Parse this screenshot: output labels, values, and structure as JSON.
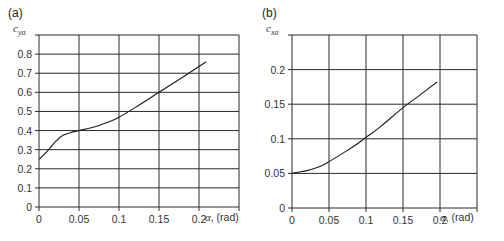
{
  "chart_data": [
    {
      "type": "line",
      "panel_label": "(a)",
      "title": "",
      "ylabel_main": "c",
      "ylabel_sub": "ya",
      "xlabel_symbol": "α",
      "xlabel_unit": ", (rad)",
      "xlim": [
        0,
        0.25
      ],
      "ylim": [
        0,
        0.9
      ],
      "xticks": [
        0,
        0.05,
        0.1,
        0.15,
        0.2
      ],
      "xtick_labels": [
        "0",
        "0.05",
        "0.1",
        "0.15",
        "0.2"
      ],
      "yticks": [
        0,
        0.1,
        0.2,
        0.3,
        0.4,
        0.5,
        0.6,
        0.7,
        0.8
      ],
      "ytick_labels": [
        "0",
        "0.1",
        "0.2",
        "0.3",
        "0.4",
        "0.5",
        "0.6",
        "0.7",
        "0.8"
      ],
      "grid": true,
      "series": [
        {
          "name": "c_ya",
          "x": [
            0,
            0.01,
            0.02,
            0.03,
            0.04,
            0.05,
            0.07,
            0.09,
            0.1,
            0.12,
            0.15,
            0.18,
            0.209
          ],
          "y": [
            0.25,
            0.29,
            0.34,
            0.375,
            0.39,
            0.4,
            0.42,
            0.45,
            0.47,
            0.52,
            0.6,
            0.68,
            0.76
          ]
        }
      ]
    },
    {
      "type": "line",
      "panel_label": "(b)",
      "title": "",
      "ylabel_main": "c",
      "ylabel_sub": "xa",
      "xlabel_symbol": "α",
      "xlabel_unit": ", (rad)",
      "xlim": [
        0,
        0.25
      ],
      "ylim": [
        0,
        0.25
      ],
      "xticks": [
        0,
        0.05,
        0.1,
        0.15,
        0.2
      ],
      "xtick_labels": [
        "0",
        "0.05",
        "0.1",
        "0.15",
        "0.2"
      ],
      "yticks": [
        0,
        0.05,
        0.1,
        0.15,
        0.2
      ],
      "ytick_labels": [
        "0",
        "0.05",
        "0.1",
        "0.15",
        "0.2"
      ],
      "grid": true,
      "series": [
        {
          "name": "c_xa",
          "x": [
            0,
            0.01,
            0.02,
            0.03,
            0.04,
            0.05,
            0.07,
            0.09,
            0.1,
            0.12,
            0.15,
            0.17,
            0.196
          ],
          "y": [
            0.05,
            0.052,
            0.054,
            0.057,
            0.061,
            0.067,
            0.08,
            0.094,
            0.102,
            0.118,
            0.145,
            0.161,
            0.182
          ]
        }
      ]
    }
  ]
}
